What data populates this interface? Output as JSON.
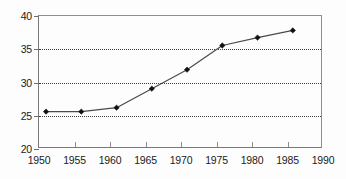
{
  "chart_data": {
    "type": "line",
    "title": "",
    "subtitle": "",
    "xlabel": "",
    "ylabel": "",
    "xlim": [
      1950,
      1990
    ],
    "ylim": [
      20,
      40
    ],
    "xticks": [
      1950,
      1955,
      1960,
      1965,
      1970,
      1975,
      1980,
      1985,
      1990
    ],
    "yticks": [
      20,
      25,
      30,
      35,
      40
    ],
    "xtick_labels": [
      "1950",
      "1955",
      "1960",
      "1965",
      "1970",
      "1975",
      "1980",
      "1985",
      "1990"
    ],
    "ytick_labels": [
      "20",
      "25",
      "30",
      "35",
      "40"
    ],
    "grid": {
      "horizontal": true,
      "vertical": false,
      "style": "dotted",
      "at_values": [
        25,
        30,
        35
      ]
    },
    "legend": {
      "visible": false,
      "position": "none",
      "entries": []
    },
    "annotations": [],
    "series": [
      {
        "name": "series-1",
        "line_color": "#4a4a4c",
        "marker": "diamond",
        "marker_color": "#101010",
        "x": [
          1951,
          1956,
          1961,
          1966,
          1971,
          1976,
          1981,
          1986
        ],
        "y": [
          25.4,
          25.4,
          26.0,
          28.9,
          31.8,
          35.5,
          36.7,
          37.8
        ]
      }
    ]
  },
  "colors": {
    "background": "#fdfdfd",
    "axis": "#77787a",
    "grid": "#3a3a3a",
    "line": "#4a4a4c",
    "marker": "#101010",
    "text": "#1b1b1b"
  }
}
